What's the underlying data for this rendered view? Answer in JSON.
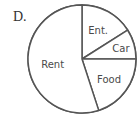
{
  "option_label": "D.",
  "chart_data": {
    "type": "pie",
    "title": "",
    "start": "top",
    "direction": "clockwise",
    "fill": "#ffffff",
    "stroke": "#555555",
    "slices": [
      {
        "label": "Ent.",
        "value": 16
      },
      {
        "label": "Car",
        "value": 9
      },
      {
        "label": "Food",
        "value": 20
      },
      {
        "label": "Rent",
        "value": 55
      }
    ],
    "legend": "none"
  }
}
